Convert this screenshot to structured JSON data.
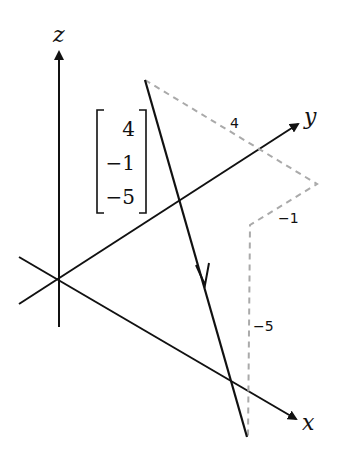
{
  "diagram": {
    "axes": {
      "x_label": "x",
      "y_label": "y",
      "z_label": "z"
    },
    "vector": {
      "components": [
        "4",
        "−1",
        "−5"
      ]
    },
    "component_labels": {
      "x_component": "4",
      "y_component": "−1",
      "z_component": "−5"
    },
    "colors": {
      "axis": "#111111",
      "vector": "#111111",
      "dashed": "#aaaaaa"
    }
  }
}
